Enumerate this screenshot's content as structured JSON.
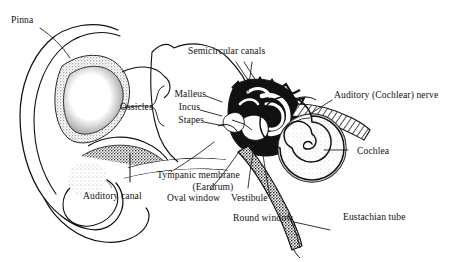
{
  "figure": {
    "background_color": "#ffffff",
    "ink_color": "#111111",
    "width": 466,
    "height": 262
  },
  "labels": {
    "pinna": "Pinna",
    "semicircular_canals": "Semicircular canals",
    "ossicles": "Ossicles",
    "malleus": "Malleus",
    "incus": "Incus",
    "stapes": "Stapes",
    "auditory_nerve": "Auditory (Cochlear) nerve",
    "cochlea": "Cochlea",
    "tympanic_membrane": "Tympanic membrane",
    "eardrum": "(Eardrum)",
    "auditory_canal": "Auditory canal",
    "oval_window": "Oval window",
    "vestibule": "Vestibule",
    "round_window": "Round window",
    "eustachian_tube": "Eustachian tube"
  }
}
